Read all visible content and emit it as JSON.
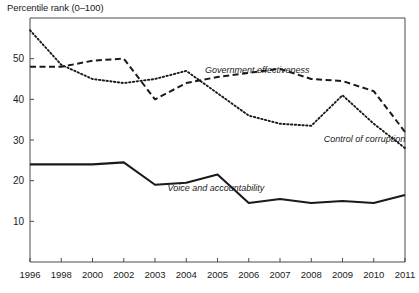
{
  "chart_data": {
    "type": "line",
    "title": "Percentile rank (0–100)",
    "xlabel": "",
    "ylabel": "Percentile rank (0–100)",
    "ylim": [
      0,
      60
    ],
    "yticks": [
      10,
      20,
      30,
      40,
      50
    ],
    "grid": false,
    "legend_position": "inline-annotations",
    "categories": [
      "1996",
      "1998",
      "2000",
      "2002",
      "2003",
      "2004",
      "2005",
      "2006",
      "2007",
      "2008",
      "2009",
      "2010",
      "2011"
    ],
    "series": [
      {
        "name": "Control of corruption",
        "style": "dotted",
        "color": "#1a1a1a",
        "values": [
          57,
          48.5,
          45,
          44,
          45,
          47,
          41.5,
          36,
          34,
          33.5,
          41,
          34,
          28
        ]
      },
      {
        "name": "Government effectiveness",
        "style": "dashed",
        "color": "#1a1a1a",
        "values": [
          48,
          48,
          49.5,
          50,
          40,
          44,
          45.5,
          46.5,
          47.5,
          45,
          44.5,
          42,
          32
        ]
      },
      {
        "name": "Voice and accountability",
        "style": "solid",
        "color": "#1a1a1a",
        "values": [
          24,
          24,
          24,
          24.5,
          19,
          19.5,
          21.5,
          14.5,
          15.5,
          14.5,
          15,
          14.5,
          16.5
        ]
      }
    ],
    "annotations": [
      {
        "text": "Government effectiveness",
        "x": 2004.6,
        "y": 46.5
      },
      {
        "text": "Control of corruption",
        "x": 2008.4,
        "y": 29.5
      },
      {
        "text": "Voice and accountability",
        "x": 2003.4,
        "y": 17.5
      }
    ]
  },
  "axes": {
    "title": "Percentile rank (0–100)",
    "y_tick_labels": [
      "50",
      "40",
      "30",
      "20",
      "10"
    ],
    "x_tick_labels": [
      "1996",
      "1998",
      "2000",
      "2002",
      "2003",
      "2004",
      "2005",
      "2006",
      "2007",
      "2008",
      "2009",
      "2010",
      "2011"
    ]
  },
  "labels": {
    "government_effectiveness": "Government effectiveness",
    "control_of_corruption": "Control of corruption",
    "voice_and_accountability": "Voice and accountability"
  },
  "colors": {
    "line": "#1a1a1a",
    "axis": "#4a4a4a",
    "text": "#1a1a1a",
    "background": "#ffffff"
  }
}
